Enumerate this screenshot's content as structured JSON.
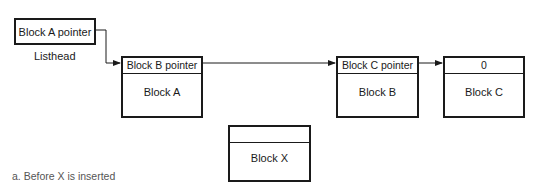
{
  "diagram": {
    "listhead": {
      "pointer_label": "Block A pointer",
      "caption": "Listhead"
    },
    "blocks": [
      {
        "id": "A",
        "header": "Block B pointer",
        "label": "Block A"
      },
      {
        "id": "B",
        "header": "Block C pointer",
        "label": "Block B"
      },
      {
        "id": "C",
        "header": "0",
        "label": "Block C"
      }
    ],
    "new_block": {
      "id": "X",
      "header": "",
      "label": "Block X"
    },
    "caption": "a. Before X is inserted",
    "edges": [
      {
        "from": "Listhead",
        "to": "Block A"
      },
      {
        "from": "Block A",
        "to": "Block B"
      },
      {
        "from": "Block B",
        "to": "Block C"
      }
    ]
  }
}
